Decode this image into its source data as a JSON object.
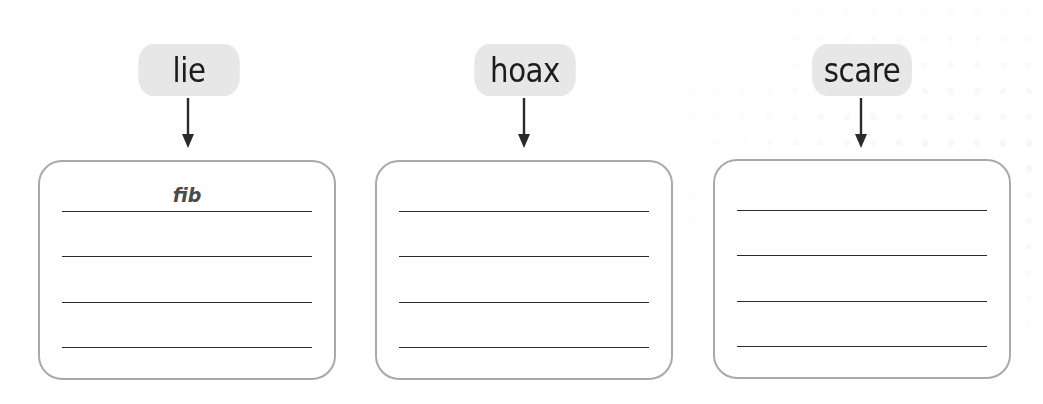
{
  "activity": {
    "items": [
      {
        "word": "lie",
        "answers": [
          "fib",
          "",
          "",
          ""
        ]
      },
      {
        "word": "hoax",
        "answers": [
          "",
          "",
          "",
          ""
        ]
      },
      {
        "word": "scare",
        "answers": [
          "",
          "",
          "",
          ""
        ]
      }
    ]
  },
  "colors": {
    "pill": "#e7e7e7",
    "box_border": "#a9a9a9",
    "line": "#2a2a2a",
    "answer_text": "#4a4a4a"
  },
  "icons": {
    "arrow": "arrow-down-icon"
  }
}
